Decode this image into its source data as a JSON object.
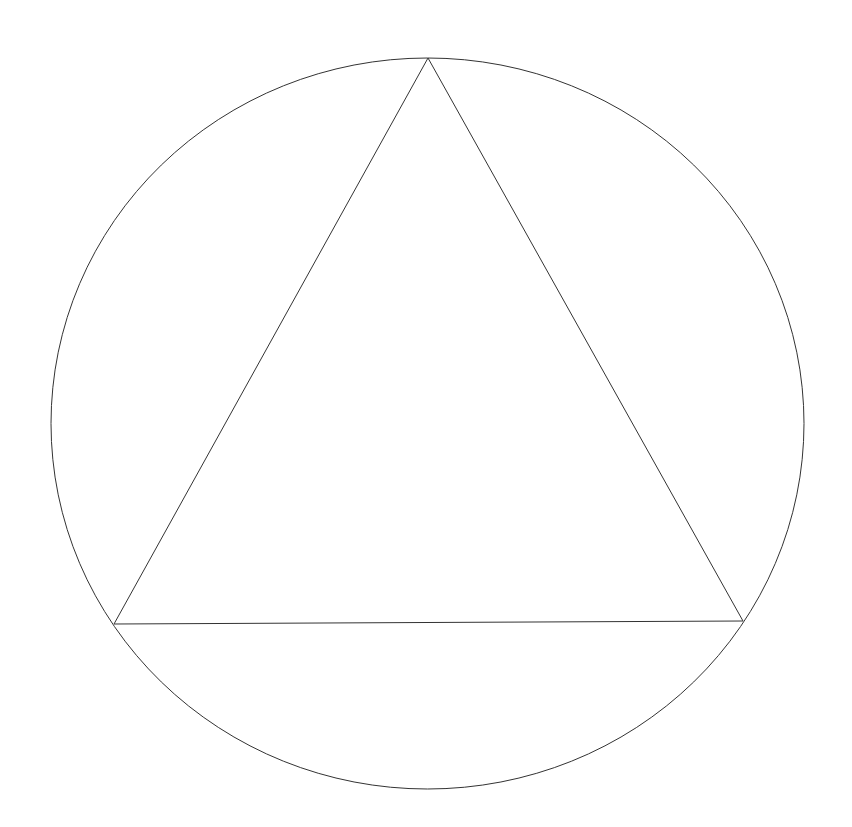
{
  "diagram": {
    "background": "#ffffff",
    "stroke_color": "#333333",
    "stroke_width": 1,
    "circle": {
      "cx": 427.5,
      "cy": 423.5,
      "rx": 376.5,
      "ry": 365.5
    },
    "triangle": {
      "vertices": [
        [
          428,
          58
        ],
        [
          114,
          624
        ],
        [
          743,
          621
        ]
      ]
    }
  }
}
